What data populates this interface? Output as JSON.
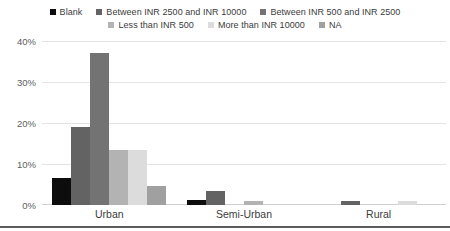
{
  "chart_data": {
    "type": "bar",
    "title": "",
    "subtitle": "",
    "xlabel": "",
    "ylabel": "",
    "categories": [
      "Urban",
      "Semi-Urban",
      "Rural"
    ],
    "ylim": [
      0,
      40
    ],
    "yticks": [
      0,
      10,
      20,
      30,
      40
    ],
    "ytick_labels": [
      "0%",
      "10%",
      "20%",
      "30%",
      "40%"
    ],
    "grid": true,
    "legend_position": "top",
    "value_suffix": "%",
    "series": [
      {
        "name": "Blank",
        "color": "#0d0d0d",
        "values": [
          6.6,
          1.2,
          0
        ]
      },
      {
        "name": "Between INR 2500 and INR 10000",
        "color": "#636363",
        "values": [
          19.0,
          3.4,
          1.0
        ]
      },
      {
        "name": "Between INR 500 and INR 2500",
        "color": "#737373",
        "values": [
          37.0,
          0,
          0
        ]
      },
      {
        "name": "Less than INR 500",
        "color": "#b3b3b3",
        "values": [
          13.3,
          1.0,
          0
        ]
      },
      {
        "name": "More than INR 10000",
        "color": "#dcdcdc",
        "values": [
          13.3,
          0,
          1.0
        ]
      },
      {
        "name": "NA",
        "color": "#a0a0a0",
        "values": [
          4.7,
          0,
          0
        ]
      }
    ]
  },
  "legend": {
    "items": [
      {
        "label": "Blank",
        "color": "#0d0d0d"
      },
      {
        "label": "Between INR 2500 and INR 10000",
        "color": "#636363"
      },
      {
        "label": "Between INR 500 and INR 2500",
        "color": "#737373"
      },
      {
        "label": "Less than INR 500",
        "color": "#b3b3b3"
      },
      {
        "label": "More than INR 10000",
        "color": "#dcdcdc"
      },
      {
        "label": "NA",
        "color": "#a0a0a0"
      }
    ]
  },
  "axes": {
    "y_tick_labels": [
      "40%",
      "30%",
      "20%",
      "10%",
      "0%"
    ],
    "x_tick_labels": [
      "Urban",
      "Semi-Urban",
      "Rural"
    ]
  },
  "colors": {
    "gridline": "#e4e4e4",
    "baseline": "#d0d0d0",
    "bottom_rule": "#5c5c5c",
    "tick_text": "#5e5e5e",
    "label_text": "#3c3c3c"
  }
}
